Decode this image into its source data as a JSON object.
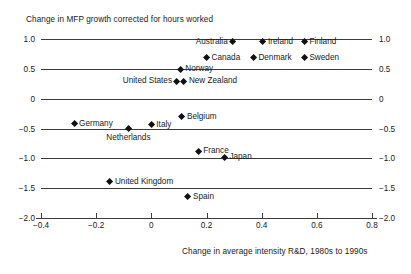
{
  "chart_data": {
    "type": "scatter",
    "title": "",
    "ylabel": "Change in MFP growth corrected for hours worked",
    "xlabel": "Change in average intensity R&D, 1980s to 1990s",
    "xlim": [
      -0.4,
      0.8
    ],
    "ylim": [
      -2.0,
      1.0
    ],
    "grid": true,
    "legend": "none",
    "xticks": [
      "-0.4",
      "-0.2",
      "0",
      "0.2",
      "0.4",
      "0.6",
      "0.8"
    ],
    "xtick_values": [
      -0.4,
      -0.2,
      0,
      0.2,
      0.4,
      0.6,
      0.8
    ],
    "yticks": [
      "1.0",
      "0.5",
      "0",
      "-0.5",
      "-1.0",
      "-1.5",
      "-2.0"
    ],
    "ytick_values": [
      1.0,
      0.5,
      0,
      -0.5,
      -1.0,
      -1.5,
      -2.0
    ],
    "marker_color": "#111111",
    "marker_shape": "diamond",
    "points": [
      {
        "label": "Australia",
        "x": 0.295,
        "y": 0.95,
        "label_pos": "left"
      },
      {
        "label": "Ireland",
        "x": 0.405,
        "y": 0.95,
        "label_pos": "right"
      },
      {
        "label": "Finland",
        "x": 0.555,
        "y": 0.95,
        "label_pos": "right"
      },
      {
        "label": "Canada",
        "x": 0.2,
        "y": 0.68,
        "label_pos": "right"
      },
      {
        "label": "Denmark",
        "x": 0.37,
        "y": 0.68,
        "label_pos": "right"
      },
      {
        "label": "Sweden",
        "x": 0.555,
        "y": 0.68,
        "label_pos": "right"
      },
      {
        "label": "Norway",
        "x": 0.105,
        "y": 0.49,
        "label_pos": "right"
      },
      {
        "label": "United States",
        "x": 0.093,
        "y": 0.29,
        "label_pos": "left"
      },
      {
        "label": "New Zealand",
        "x": 0.118,
        "y": 0.29,
        "label_pos": "right"
      },
      {
        "label": "Belgium",
        "x": 0.111,
        "y": -0.3,
        "label_pos": "right"
      },
      {
        "label": "Germany",
        "x": -0.28,
        "y": -0.42,
        "label_pos": "right"
      },
      {
        "label": "Italy",
        "x": 0.0,
        "y": -0.44,
        "label_pos": "right"
      },
      {
        "label": "Netherlands",
        "x": -0.083,
        "y": -0.5,
        "label_pos": "below"
      },
      {
        "label": "France",
        "x": 0.17,
        "y": -0.88,
        "label_pos": "right"
      },
      {
        "label": "Japan",
        "x": 0.265,
        "y": -0.98,
        "label_pos": "right"
      },
      {
        "label": "United Kingdom",
        "x": -0.15,
        "y": -1.39,
        "label_pos": "right"
      },
      {
        "label": "Spain",
        "x": 0.133,
        "y": -1.64,
        "label_pos": "right"
      }
    ]
  }
}
